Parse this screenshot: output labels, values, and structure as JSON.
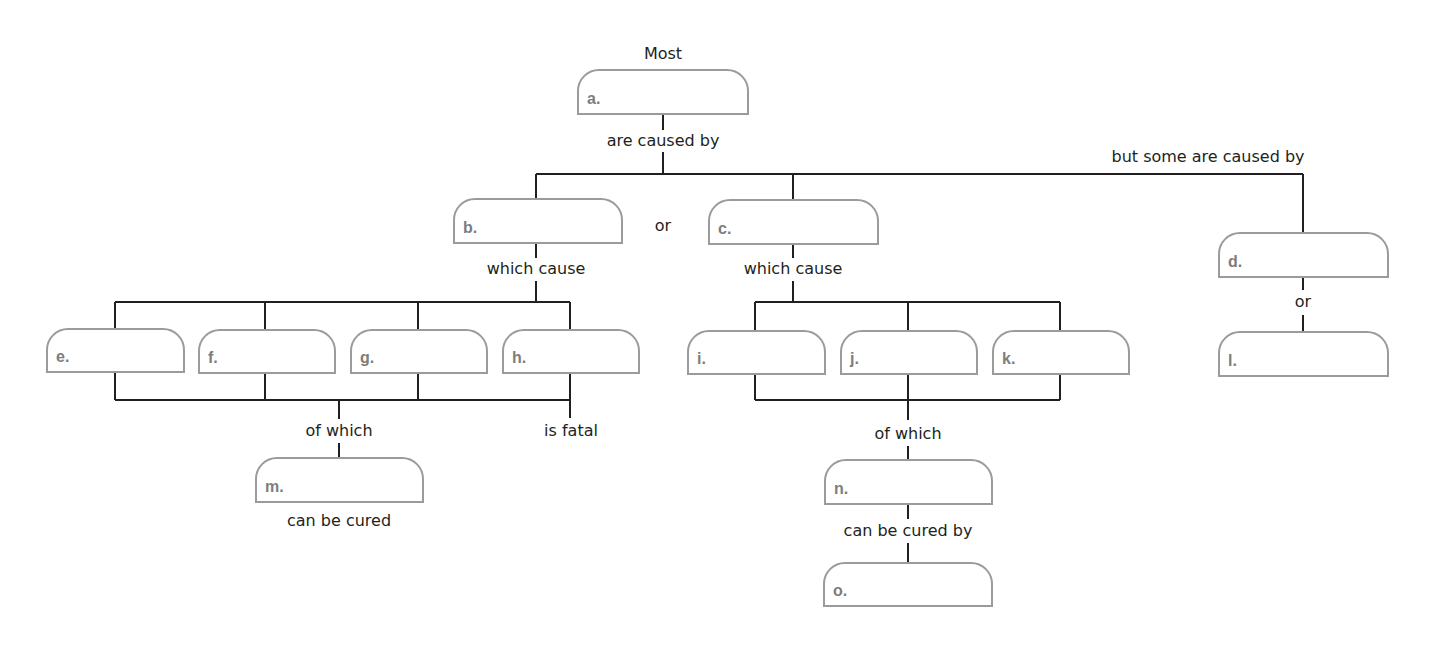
{
  "diagram": {
    "type": "concept-map",
    "colors": {
      "line": "#231f20",
      "box_border": "#9b9b9b",
      "letter": "#7d7d7d",
      "text": "#231f20",
      "background": "#ffffff"
    },
    "nodes": {
      "a": {
        "letter": "a.",
        "answer": "",
        "x": 577,
        "y": 69,
        "w": 172,
        "h": 46
      },
      "b": {
        "letter": "b.",
        "answer": "",
        "x": 453,
        "y": 198,
        "w": 170,
        "h": 46
      },
      "c": {
        "letter": "c.",
        "answer": "",
        "x": 708,
        "y": 199,
        "w": 171,
        "h": 46
      },
      "d": {
        "letter": "d.",
        "answer": "",
        "x": 1218,
        "y": 232,
        "w": 171,
        "h": 46
      },
      "e": {
        "letter": "e.",
        "answer": "",
        "x": 46,
        "y": 328,
        "w": 139,
        "h": 45
      },
      "f": {
        "letter": "f.",
        "answer": "",
        "x": 198,
        "y": 329,
        "w": 138,
        "h": 45
      },
      "g": {
        "letter": "g.",
        "answer": "",
        "x": 350,
        "y": 329,
        "w": 138,
        "h": 45
      },
      "h": {
        "letter": "h.",
        "answer": "",
        "x": 502,
        "y": 329,
        "w": 138,
        "h": 45
      },
      "i": {
        "letter": "i.",
        "answer": "",
        "x": 687,
        "y": 330,
        "w": 139,
        "h": 45
      },
      "j": {
        "letter": "j.",
        "answer": "",
        "x": 840,
        "y": 330,
        "w": 138,
        "h": 45
      },
      "k": {
        "letter": "k.",
        "answer": "",
        "x": 992,
        "y": 330,
        "w": 138,
        "h": 45
      },
      "l": {
        "letter": "l.",
        "answer": "",
        "x": 1218,
        "y": 331,
        "w": 171,
        "h": 46
      },
      "m": {
        "letter": "m.",
        "answer": "",
        "x": 255,
        "y": 457,
        "w": 169,
        "h": 46
      },
      "n": {
        "letter": "n.",
        "answer": "",
        "x": 824,
        "y": 459,
        "w": 169,
        "h": 46
      },
      "o": {
        "letter": "o.",
        "answer": "",
        "x": 823,
        "y": 562,
        "w": 170,
        "h": 45
      }
    },
    "labels": {
      "most": "Most",
      "are_caused_by": "are caused by",
      "but_some_are_caused_by": "but some are caused by",
      "or_bc": "or",
      "which_cause_b": "which cause",
      "which_cause_c": "which cause",
      "or_dl": "or",
      "of_which_left": "of which",
      "is_fatal": "is fatal",
      "can_be_cured": "can be cured",
      "of_which_right": "of which",
      "can_be_cured_by": "can be cured by"
    }
  }
}
